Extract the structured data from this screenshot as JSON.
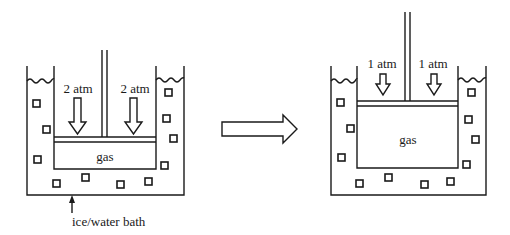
{
  "diagram": {
    "title": "",
    "before": {
      "pressure_left_label": "2 atm",
      "pressure_right_label": "2 atm",
      "gas_label": "gas",
      "bath_label": "ice/water bath"
    },
    "after": {
      "pressure_left_label": "1 atm",
      "pressure_right_label": "1 atm",
      "gas_label": "gas"
    },
    "transition_arrow": "right-arrow",
    "colors": {
      "ink": "#1a1a1a",
      "background": "#ffffff"
    }
  }
}
